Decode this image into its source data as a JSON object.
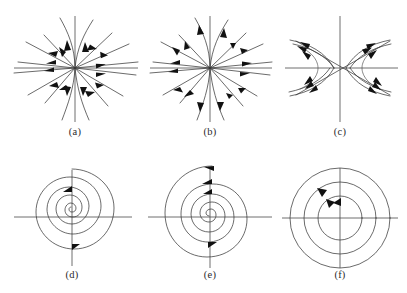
{
  "figure": {
    "width": 407,
    "height": 293,
    "background_color": "#ffffff",
    "line_color": "#3a3a3a",
    "axis_color": "#4a4a4a",
    "arrow_color": "#111111",
    "caption_color": "#2b2b2b"
  },
  "panels": [
    {
      "id": "a",
      "label": "(a)",
      "type": "stable-node",
      "description": "Stable node (sink): straight and slightly curved trajectories converging on the origin, arrows pointing inward",
      "center": {
        "x": 75,
        "y": 68
      },
      "arrow_direction": "inward",
      "ray_count": 14,
      "label_position": {
        "x": 75,
        "y": 133
      }
    },
    {
      "id": "b",
      "label": "(b)",
      "type": "unstable-node",
      "description": "Unstable node (source): straight and slightly curved trajectories radiating from the origin, arrows pointing outward",
      "center": {
        "x": 210,
        "y": 68
      },
      "arrow_direction": "outward",
      "ray_count": 14,
      "label_position": {
        "x": 210,
        "y": 133
      }
    },
    {
      "id": "c",
      "label": "(c)",
      "type": "saddle-point",
      "description": "Saddle point: hyperbolic trajectories with two diagonal asymptotes, arrows flowing in along one axis and out along the other",
      "center": {
        "x": 340,
        "y": 68
      },
      "arrow_direction": "saddle",
      "branch_count": 4,
      "label_position": {
        "x": 340,
        "y": 133
      }
    },
    {
      "id": "d",
      "label": "(d)",
      "type": "stable-spiral",
      "description": "Stable spiral (spiral sink): trajectory spiralling inward toward the origin",
      "center": {
        "x": 72,
        "y": 217
      },
      "arrow_direction": "inward",
      "turns": 2.5,
      "label_position": {
        "x": 72,
        "y": 277
      }
    },
    {
      "id": "e",
      "label": "(e)",
      "type": "unstable-spiral",
      "description": "Unstable spiral (spiral source): trajectory spiralling outward away from the origin",
      "center": {
        "x": 210,
        "y": 217
      },
      "arrow_direction": "outward",
      "turns": 2.5,
      "label_position": {
        "x": 210,
        "y": 277
      }
    },
    {
      "id": "f",
      "label": "(f)",
      "type": "center",
      "description": "Center: three concentric closed orbits around the origin, arrows counterclockwise",
      "center": {
        "x": 340,
        "y": 218
      },
      "arrow_direction": "counterclockwise",
      "orbit_count": 3,
      "orbit_radii": [
        22,
        36,
        50
      ],
      "label_position": {
        "x": 340,
        "y": 277
      }
    }
  ]
}
